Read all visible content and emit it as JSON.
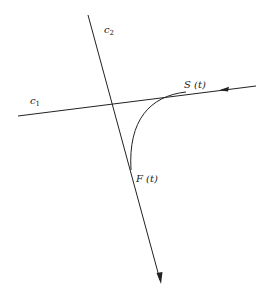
{
  "labels": {
    "c1": "c",
    "c1_sub": "1",
    "c2": "c",
    "c2_sub": "2",
    "S": "S (t)",
    "F": "F (t)"
  },
  "colors": {
    "stroke": "#222222",
    "background": "#ffffff"
  }
}
